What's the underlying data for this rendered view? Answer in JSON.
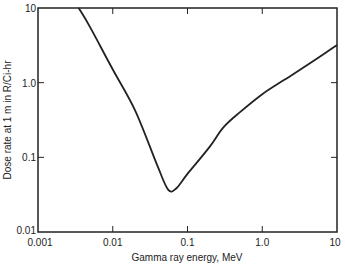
{
  "chart_data": {
    "type": "line",
    "title": "",
    "xlabel": "Gamma ray energy, MeV",
    "ylabel": "Dose rate at 1 m in R/Ci-hr",
    "xscale": "log",
    "yscale": "log",
    "xlim": [
      0.001,
      10
    ],
    "ylim": [
      0.01,
      10
    ],
    "x_ticks": [
      "0.001",
      "0.01",
      "0.1",
      "1.0",
      "10"
    ],
    "y_ticks": [
      "0.01",
      "0.1",
      "1.0",
      "10"
    ],
    "grid": false,
    "legend": null,
    "series": [
      {
        "name": "Dose rate",
        "x": [
          0.0035,
          0.005,
          0.01,
          0.02,
          0.04,
          0.055,
          0.07,
          0.1,
          0.2,
          0.3,
          0.5,
          1.0,
          2.0,
          5.0,
          10
        ],
        "y": [
          10,
          5.5,
          1.5,
          0.42,
          0.075,
          0.037,
          0.038,
          0.06,
          0.14,
          0.25,
          0.4,
          0.7,
          1.1,
          2.0,
          3.2
        ]
      }
    ]
  }
}
